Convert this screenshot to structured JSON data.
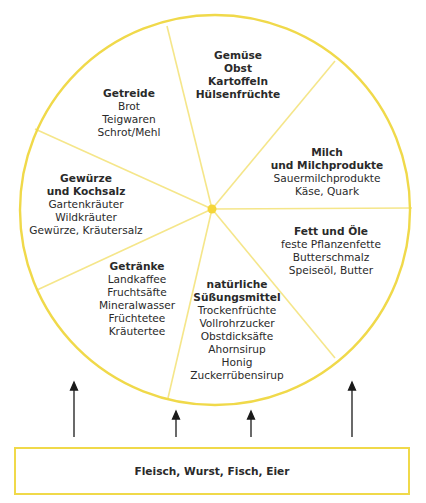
{
  "colors": {
    "ring": "#f0d94a",
    "spoke": "#f5e68a",
    "center": "#f5d63a",
    "arrow": "#1a1a1a"
  },
  "segments": [
    {
      "title": [
        "Gemüse",
        "Obst",
        "Kartoffeln",
        "Hülsenfrüchte"
      ],
      "items": []
    },
    {
      "title": [
        "Milch",
        "und Milchprodukte"
      ],
      "items": [
        "Sauermilchprodukte",
        "Käse, Quark"
      ]
    },
    {
      "title": [
        "Fett und Öle"
      ],
      "items": [
        "feste Pflanzenfette",
        "Butterschmalz",
        "Speiseöl, Butter"
      ]
    },
    {
      "title": [
        "natürliche",
        "Süßungsmittel"
      ],
      "items": [
        "Trockenfrüchte",
        "Vollrohrzucker",
        "Obstdicksäfte",
        "Ahornsirup",
        "Honig",
        "Zuckerrübensirup"
      ]
    },
    {
      "title": [
        "Getränke"
      ],
      "items": [
        "Landkaffee",
        "Fruchtsäfte",
        "Mineralwasser",
        "Früchtetee",
        "Kräutertee"
      ]
    },
    {
      "title": [
        "Gewürze",
        "und Kochsalz"
      ],
      "items": [
        "Gartenkräuter",
        "Wildkräuter",
        "Gewürze, Kräutersalz"
      ]
    },
    {
      "title": [
        "Getreide"
      ],
      "items": [
        "Brot",
        "Teigwaren",
        "Schrot/Mehl"
      ]
    }
  ],
  "base": {
    "label": "Fleisch, Wurst, Fisch, Eier"
  }
}
